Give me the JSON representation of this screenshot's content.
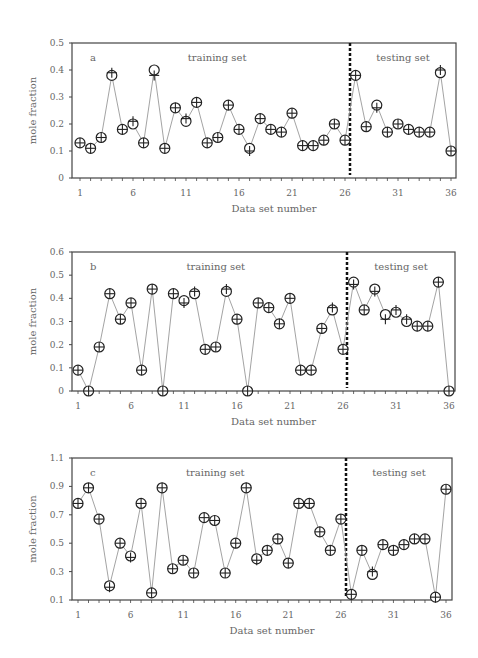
{
  "chart_data": [
    {
      "type": "line",
      "panel": "a",
      "title": "",
      "xlabel": "Data set number",
      "ylabel": "mole fraction",
      "ylim": [
        0,
        0.5
      ],
      "yticks": [
        "0",
        "0.1",
        "0.2",
        "0.3",
        "0.4",
        "0.5"
      ],
      "xticks": [
        "1",
        "6",
        "11",
        "16",
        "21",
        "26",
        "31",
        "36"
      ],
      "annotations": [
        "a",
        "training set",
        "testing set"
      ],
      "split_after": 26,
      "x": [
        1,
        2,
        3,
        4,
        5,
        6,
        7,
        8,
        9,
        10,
        11,
        12,
        13,
        14,
        15,
        16,
        17,
        18,
        19,
        20,
        21,
        22,
        23,
        24,
        25,
        26,
        27,
        28,
        29,
        30,
        31,
        32,
        33,
        34,
        35,
        36
      ],
      "series": [
        {
          "name": "predicted (circle)",
          "values": [
            0.13,
            0.11,
            0.15,
            0.38,
            0.18,
            0.2,
            0.13,
            0.4,
            0.11,
            0.26,
            0.21,
            0.28,
            0.13,
            0.15,
            0.27,
            0.18,
            0.11,
            0.22,
            0.18,
            0.17,
            0.24,
            0.12,
            0.12,
            0.14,
            0.2,
            0.14,
            0.38,
            0.19,
            0.27,
            0.17,
            0.2,
            0.18,
            0.17,
            0.17,
            0.39,
            0.1
          ]
        },
        {
          "name": "experimental (plus)",
          "values": [
            0.13,
            0.11,
            0.15,
            0.39,
            0.18,
            0.21,
            0.13,
            0.38,
            0.11,
            0.26,
            0.22,
            0.28,
            0.13,
            0.15,
            0.27,
            0.18,
            0.1,
            0.22,
            0.18,
            0.17,
            0.24,
            0.12,
            0.12,
            0.14,
            0.2,
            0.14,
            0.38,
            0.19,
            0.26,
            0.17,
            0.2,
            0.18,
            0.17,
            0.17,
            0.4,
            0.1
          ]
        }
      ]
    },
    {
      "type": "line",
      "panel": "b",
      "title": "",
      "xlabel": "Data set number",
      "ylabel": "mole fraction",
      "ylim": [
        0,
        0.6
      ],
      "yticks": [
        "0",
        "0.1",
        "0.2",
        "0.3",
        "0.4",
        "0.5",
        "0.6"
      ],
      "xticks": [
        "1",
        "6",
        "11",
        "16",
        "21",
        "26",
        "31",
        "36"
      ],
      "annotations": [
        "b",
        "training set",
        "testing set"
      ],
      "split_after": 26,
      "x": [
        1,
        2,
        3,
        4,
        5,
        6,
        7,
        8,
        9,
        10,
        11,
        12,
        13,
        14,
        15,
        16,
        17,
        18,
        19,
        20,
        21,
        22,
        23,
        24,
        25,
        26,
        27,
        28,
        29,
        30,
        31,
        32,
        33,
        34,
        35,
        36
      ],
      "series": [
        {
          "name": "predicted (circle)",
          "values": [
            0.09,
            0.0,
            0.19,
            0.42,
            0.31,
            0.38,
            0.09,
            0.44,
            0.0,
            0.42,
            0.39,
            0.42,
            0.18,
            0.19,
            0.43,
            0.31,
            0.0,
            0.38,
            0.36,
            0.29,
            0.4,
            0.09,
            0.09,
            0.27,
            0.35,
            0.18,
            0.47,
            0.35,
            0.44,
            0.33,
            0.34,
            0.3,
            0.28,
            0.28,
            0.47,
            0.0
          ]
        },
        {
          "name": "experimental (plus)",
          "values": [
            0.09,
            0.0,
            0.19,
            0.42,
            0.31,
            0.38,
            0.09,
            0.44,
            0.0,
            0.42,
            0.38,
            0.43,
            0.18,
            0.19,
            0.44,
            0.31,
            0.0,
            0.38,
            0.36,
            0.29,
            0.4,
            0.09,
            0.09,
            0.27,
            0.36,
            0.18,
            0.46,
            0.35,
            0.43,
            0.31,
            0.35,
            0.31,
            0.28,
            0.28,
            0.47,
            0.0
          ]
        }
      ]
    },
    {
      "type": "line",
      "panel": "c",
      "title": "",
      "xlabel": "Data set number",
      "ylabel": "mole fraction",
      "ylim": [
        0.1,
        1.1
      ],
      "yticks": [
        "0.1",
        "0.3",
        "0.5",
        "0.7",
        "0.9",
        "1.1"
      ],
      "xticks": [
        "1",
        "6",
        "11",
        "16",
        "21",
        "26",
        "31",
        "36"
      ],
      "annotations": [
        "c",
        "training set",
        "testing set"
      ],
      "split_after": 26,
      "x": [
        1,
        2,
        3,
        4,
        5,
        6,
        7,
        8,
        9,
        10,
        11,
        12,
        13,
        14,
        15,
        16,
        17,
        18,
        19,
        20,
        21,
        22,
        23,
        24,
        25,
        26,
        27,
        28,
        29,
        30,
        31,
        32,
        33,
        34,
        35,
        36
      ],
      "series": [
        {
          "name": "predicted (circle)",
          "values": [
            0.78,
            0.89,
            0.67,
            0.2,
            0.5,
            0.41,
            0.78,
            0.15,
            0.89,
            0.32,
            0.38,
            0.29,
            0.68,
            0.66,
            0.29,
            0.5,
            0.89,
            0.39,
            0.45,
            0.53,
            0.36,
            0.78,
            0.78,
            0.58,
            0.45,
            0.67,
            0.14,
            0.45,
            0.28,
            0.49,
            0.45,
            0.49,
            0.53,
            0.53,
            0.12,
            0.88
          ]
        },
        {
          "name": "experimental (plus)",
          "values": [
            0.78,
            0.89,
            0.67,
            0.19,
            0.5,
            0.4,
            0.78,
            0.15,
            0.89,
            0.32,
            0.38,
            0.29,
            0.68,
            0.66,
            0.29,
            0.5,
            0.89,
            0.38,
            0.45,
            0.53,
            0.36,
            0.78,
            0.78,
            0.58,
            0.45,
            0.67,
            0.14,
            0.45,
            0.3,
            0.49,
            0.45,
            0.49,
            0.53,
            0.53,
            0.12,
            0.88
          ]
        }
      ]
    }
  ],
  "panels": [
    {
      "box": [
        72,
        43,
        456,
        178
      ],
      "xfirst": 80,
      "xlast": 451,
      "split_x": 350
    },
    {
      "box": [
        72,
        252,
        455,
        391
      ],
      "xfirst": 78,
      "xlast": 449,
      "split_x": 347
    },
    {
      "box": [
        72,
        458,
        452,
        600
      ],
      "xfirst": 78,
      "xlast": 446,
      "split_x": 346
    }
  ],
  "colors": {
    "line": "#999999",
    "marker": "#222222",
    "axis": "#444444",
    "divider": "#111111"
  }
}
